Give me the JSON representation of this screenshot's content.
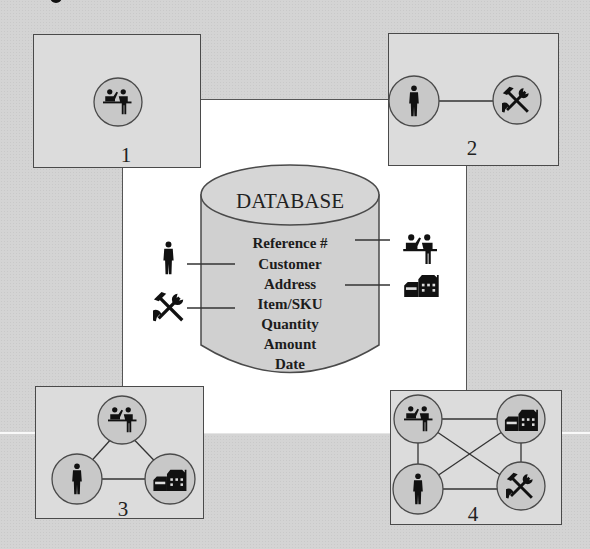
{
  "diagram": {
    "center": {
      "title": "DATABASE",
      "fields": [
        "Reference #",
        "Customer",
        "Address",
        "Item/SKU",
        "Quantity",
        "Amount",
        "Date"
      ],
      "links": [
        {
          "field": "Reference #",
          "icon": "sales-counter-icon",
          "side": "right"
        },
        {
          "field": "Customer",
          "icon": "person-icon",
          "side": "left"
        },
        {
          "field": "Address",
          "icon": "house-icon",
          "side": "right"
        },
        {
          "field": "Item/SKU",
          "icon": "tools-icon",
          "side": "left"
        }
      ]
    },
    "panels": [
      {
        "number": "1",
        "nodes": [
          "sales-counter-icon"
        ],
        "edges": []
      },
      {
        "number": "2",
        "nodes": [
          "person-icon",
          "tools-icon"
        ],
        "edges": [
          [
            "person",
            "tools"
          ]
        ]
      },
      {
        "number": "3",
        "nodes": [
          "sales-counter-icon",
          "person-icon",
          "house-icon"
        ],
        "edges": [
          [
            "sales",
            "person"
          ],
          [
            "sales",
            "house"
          ],
          [
            "person",
            "house"
          ]
        ]
      },
      {
        "number": "4",
        "nodes": [
          "sales-counter-icon",
          "house-icon",
          "person-icon",
          "tools-icon"
        ],
        "edges": [
          [
            "sales",
            "house"
          ],
          [
            "sales",
            "person"
          ],
          [
            "sales",
            "tools"
          ],
          [
            "house",
            "person"
          ],
          [
            "house",
            "tools"
          ],
          [
            "person",
            "tools"
          ]
        ]
      }
    ],
    "colors": {
      "background": "#d4d4d4",
      "panel": "#dcdcdc",
      "node_fill": "#c8c8c8",
      "center": "#ffffff",
      "cylinder": "#d0d0d0",
      "stroke": "#4a4a4a",
      "ink": "#1c1c1c"
    }
  }
}
